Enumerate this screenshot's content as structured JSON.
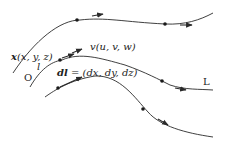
{
  "diagram": {
    "type": "streamlines",
    "labels": {
      "position": "x(x, y, z)",
      "position_vec": "x",
      "position_args": "(x, y, z)",
      "velocity": "v(u, v, w)",
      "velocity_vec": "v",
      "velocity_args": "(u, v, w)",
      "line_element": "dl = (dx, dy, dz)",
      "line_element_vec": "dl",
      "line_element_args": " = (dx, dy, dz)",
      "origin": "O",
      "curve_l": "l",
      "streamline": "L"
    },
    "colors": {
      "line": "#2a2a2a",
      "background": "#ffffff"
    },
    "curves": [
      {
        "name": "top-streamline",
        "path": "M13,73 C35,40 60,20 80,20 C105,17 125,22 165,24 C185,25 200,20 213,13"
      },
      {
        "name": "middle-streamline",
        "path": "M30,87 C40,70 50,62 62,60 C80,52 100,58 125,65 C145,72 160,80 170,85 C185,90 200,89 213,90"
      },
      {
        "name": "bottom-streamline",
        "path": "M45,97 C55,90 70,80 95,76 C120,75 135,98 148,112 C160,126 185,133 213,137"
      }
    ],
    "points": [
      {
        "x": 77,
        "y": 20
      },
      {
        "x": 165,
        "y": 24
      },
      {
        "x": 60,
        "y": 60
      },
      {
        "x": 162,
        "y": 81
      },
      {
        "x": 58,
        "y": 88
      },
      {
        "x": 143,
        "y": 109
      }
    ],
    "arrows": [
      {
        "x1": 92,
        "y1": 16,
        "x2": 103,
        "y2": 14
      },
      {
        "x1": 180,
        "y1": 25,
        "x2": 192,
        "y2": 25
      },
      {
        "x1": 62,
        "y1": 58,
        "x2": 74,
        "y2": 54
      },
      {
        "x1": 72,
        "y1": 53,
        "x2": 82,
        "y2": 49
      },
      {
        "x1": 175,
        "y1": 88,
        "x2": 186,
        "y2": 90
      },
      {
        "x1": 60,
        "y1": 87,
        "x2": 82,
        "y2": 77
      },
      {
        "x1": 158,
        "y1": 119,
        "x2": 168,
        "y2": 125
      }
    ]
  }
}
